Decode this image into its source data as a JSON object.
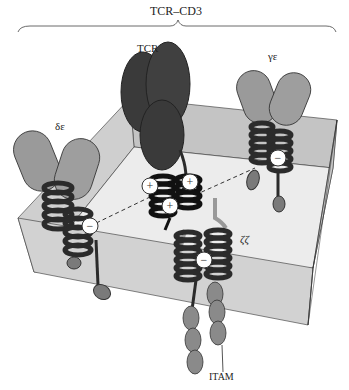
{
  "figure": {
    "title": "TCR–CD3",
    "labels": {
      "tcr": "TCR",
      "delta_epsilon": "δε",
      "gamma_epsilon": "γε",
      "zeta_zeta": "ζζ",
      "itam": "ITAM"
    },
    "charges": {
      "positive": "+",
      "negative": "−"
    },
    "colors": {
      "membrane_top": "#e6e6e6",
      "membrane_side": "#c8c8c8",
      "membrane_back": "#bdbdbd",
      "tcr_dark": "#3a3a3a",
      "cd3_ectodomain": "#9a9a9a",
      "helix": "#2b2b2b",
      "cytoplasmic": "#7a7a7a"
    }
  }
}
